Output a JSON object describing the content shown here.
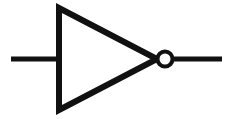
{
  "figure": {
    "name": "NOT gate (inverter) logic symbol",
    "width": 233,
    "height": 119,
    "background_color": "#ffffff",
    "stroke_color": "#000000",
    "title": "",
    "caption": ""
  },
  "symbol": {
    "type": "not-gate",
    "label": "",
    "stroke_color": "#111111",
    "fill_color": "#ffffff",
    "input_wire": {
      "label": "",
      "x1": 11,
      "y1": 59,
      "x2": 59,
      "y2": 59,
      "thickness": 5
    },
    "triangle": {
      "label": "",
      "points": "59,8 59,110 157,59",
      "thickness": 6,
      "fill": "none"
    },
    "bubble": {
      "label": "",
      "cx": 165,
      "cy": 59,
      "r": 7.5,
      "thickness": 4,
      "fill": "#ffffff"
    },
    "output_wire": {
      "label": "",
      "x1": 173,
      "y1": 59,
      "x2": 222,
      "y2": 59,
      "thickness": 5
    }
  }
}
